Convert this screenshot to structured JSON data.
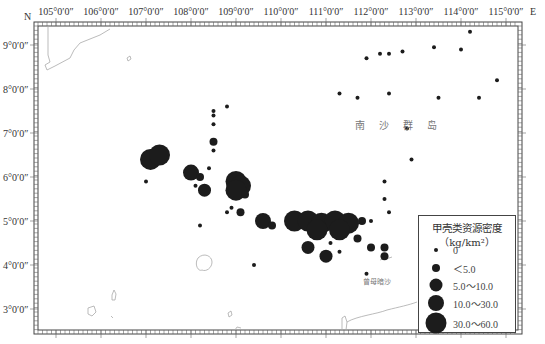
{
  "map": {
    "axis": {
      "north_label": "N",
      "east_label": "E",
      "longitude_labels": [
        {
          "text": "105°0′0″",
          "x": 56
        },
        {
          "text": "106°0′0″",
          "x": 101
        },
        {
          "text": "107°0′0″",
          "x": 146
        },
        {
          "text": "108°0′0″",
          "x": 191
        },
        {
          "text": "109°0′0″",
          "x": 236
        },
        {
          "text": "110°0′0″",
          "x": 281
        },
        {
          "text": "111°0′0″",
          "x": 326
        },
        {
          "text": "112°0′0″",
          "x": 371
        },
        {
          "text": "113°0′0″",
          "x": 416
        },
        {
          "text": "114°0′0″",
          "x": 461
        },
        {
          "text": "115°0′0″",
          "x": 506
        }
      ],
      "latitude_labels": [
        {
          "text": "9°0′0″",
          "y": 45
        },
        {
          "text": "8°0′0″",
          "y": 89
        },
        {
          "text": "7°0′0″",
          "y": 133
        },
        {
          "text": "6°0′0″",
          "y": 177
        },
        {
          "text": "5°0′0″",
          "y": 221
        },
        {
          "text": "4°0′0″",
          "y": 265
        },
        {
          "text": "3°0′0″",
          "y": 309
        }
      ]
    },
    "place_labels": {
      "nansha": "南沙群岛",
      "zengmu": "曾母暗沙"
    },
    "legend": {
      "title": "甲壳类资源密度",
      "unit": "（kg/km²）",
      "classes": [
        {
          "label": "0",
          "size": 4
        },
        {
          "label": "＜5.0",
          "size": 8
        },
        {
          "label": "5.0～10.0",
          "size": 13
        },
        {
          "label": "10.0～30.0",
          "size": 16
        },
        {
          "label": "30.0～60.0",
          "size": 21
        }
      ]
    },
    "colors": {
      "dot": "#1c1c1c",
      "frame": "#444444",
      "coastline": "#aaaaaa"
    }
  },
  "chart_data": {
    "type": "scatter",
    "xlabel": "Longitude (E)",
    "ylabel": "Latitude (N)",
    "xlim": [
      104.6,
      115.3
    ],
    "ylim": [
      2.5,
      9.5
    ],
    "legend_position": "bottom-right",
    "stations": [
      {
        "lon": 107.1,
        "lat": 6.4,
        "cls": 4
      },
      {
        "lon": 107.3,
        "lat": 6.5,
        "cls": 4
      },
      {
        "lon": 107.0,
        "lat": 5.9,
        "cls": 0
      },
      {
        "lon": 108.0,
        "lat": 6.1,
        "cls": 3
      },
      {
        "lon": 108.2,
        "lat": 6.0,
        "cls": 1
      },
      {
        "lon": 108.3,
        "lat": 5.7,
        "cls": 2
      },
      {
        "lon": 108.1,
        "lat": 5.8,
        "cls": 0
      },
      {
        "lon": 108.5,
        "lat": 7.5,
        "cls": 0
      },
      {
        "lon": 108.5,
        "lat": 7.4,
        "cls": 0
      },
      {
        "lon": 108.8,
        "lat": 7.6,
        "cls": 0
      },
      {
        "lon": 108.5,
        "lat": 7.2,
        "cls": 0
      },
      {
        "lon": 108.5,
        "lat": 6.8,
        "cls": 1
      },
      {
        "lon": 108.5,
        "lat": 6.6,
        "cls": 0
      },
      {
        "lon": 108.4,
        "lat": 6.2,
        "cls": 0
      },
      {
        "lon": 108.2,
        "lat": 4.9,
        "cls": 0
      },
      {
        "lon": 109.0,
        "lat": 5.9,
        "cls": 4
      },
      {
        "lon": 109.1,
        "lat": 5.8,
        "cls": 4
      },
      {
        "lon": 109.0,
        "lat": 5.7,
        "cls": 4
      },
      {
        "lon": 109.2,
        "lat": 5.6,
        "cls": 1
      },
      {
        "lon": 109.1,
        "lat": 5.2,
        "cls": 1
      },
      {
        "lon": 108.9,
        "lat": 5.3,
        "cls": 0
      },
      {
        "lon": 108.8,
        "lat": 5.2,
        "cls": 0
      },
      {
        "lon": 109.6,
        "lat": 5.0,
        "cls": 3
      },
      {
        "lon": 109.8,
        "lat": 4.9,
        "cls": 1
      },
      {
        "lon": 109.4,
        "lat": 4.0,
        "cls": 0
      },
      {
        "lon": 110.3,
        "lat": 5.0,
        "cls": 4
      },
      {
        "lon": 110.6,
        "lat": 5.0,
        "cls": 4
      },
      {
        "lon": 110.9,
        "lat": 4.95,
        "cls": 4
      },
      {
        "lon": 111.2,
        "lat": 5.0,
        "cls": 4
      },
      {
        "lon": 111.5,
        "lat": 4.95,
        "cls": 4
      },
      {
        "lon": 110.8,
        "lat": 4.8,
        "cls": 4
      },
      {
        "lon": 111.3,
        "lat": 4.8,
        "cls": 4
      },
      {
        "lon": 111.8,
        "lat": 5.0,
        "cls": 1
      },
      {
        "lon": 112.0,
        "lat": 5.0,
        "cls": 0
      },
      {
        "lon": 110.6,
        "lat": 4.4,
        "cls": 2
      },
      {
        "lon": 111.0,
        "lat": 4.2,
        "cls": 2
      },
      {
        "lon": 111.1,
        "lat": 4.5,
        "cls": 0
      },
      {
        "lon": 111.3,
        "lat": 4.3,
        "cls": 0
      },
      {
        "lon": 111.7,
        "lat": 4.6,
        "cls": 1
      },
      {
        "lon": 112.0,
        "lat": 4.4,
        "cls": 1
      },
      {
        "lon": 112.3,
        "lat": 4.4,
        "cls": 1
      },
      {
        "lon": 112.3,
        "lat": 4.2,
        "cls": 1
      },
      {
        "lon": 111.9,
        "lat": 3.8,
        "cls": 0
      },
      {
        "lon": 112.9,
        "lat": 6.4,
        "cls": 0
      },
      {
        "lon": 112.3,
        "lat": 5.9,
        "cls": 0
      },
      {
        "lon": 112.3,
        "lat": 5.5,
        "cls": 0
      },
      {
        "lon": 112.4,
        "lat": 5.2,
        "cls": 0
      },
      {
        "lon": 112.8,
        "lat": 7.1,
        "cls": 0
      },
      {
        "lon": 111.3,
        "lat": 7.9,
        "cls": 0
      },
      {
        "lon": 111.7,
        "lat": 7.8,
        "cls": 0
      },
      {
        "lon": 111.9,
        "lat": 8.7,
        "cls": 0
      },
      {
        "lon": 112.2,
        "lat": 8.8,
        "cls": 0
      },
      {
        "lon": 112.4,
        "lat": 8.8,
        "cls": 0
      },
      {
        "lon": 112.7,
        "lat": 8.85,
        "cls": 0
      },
      {
        "lon": 113.4,
        "lat": 8.95,
        "cls": 0
      },
      {
        "lon": 114.0,
        "lat": 8.9,
        "cls": 0
      },
      {
        "lon": 114.2,
        "lat": 9.3,
        "cls": 0
      },
      {
        "lon": 114.4,
        "lat": 7.8,
        "cls": 0
      },
      {
        "lon": 113.5,
        "lat": 7.8,
        "cls": 0
      },
      {
        "lon": 112.4,
        "lat": 7.9,
        "cls": 0
      },
      {
        "lon": 114.8,
        "lat": 8.2,
        "cls": 0
      }
    ]
  }
}
